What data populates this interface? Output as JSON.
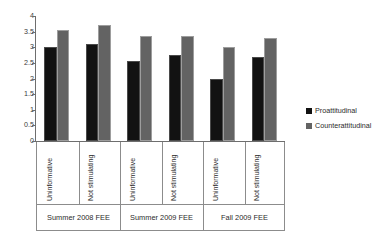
{
  "chart_data": {
    "type": "bar",
    "title": "",
    "subtitle": "",
    "xlabel": "",
    "ylabel": "",
    "ylim": [
      0,
      4
    ],
    "ytick_labels": [
      "4",
      "3.5",
      "3",
      "2.5",
      "2",
      "1.5",
      "1",
      "0.5",
      "0"
    ],
    "ytick_values": [
      4,
      3.5,
      3,
      2.5,
      2,
      1.5,
      1,
      0.5,
      0
    ],
    "grid": false,
    "legend_position": "right",
    "categories": [
      "Uninformative",
      "Not stimulating",
      "Uninformative",
      "Not stimulating",
      "Uninformative",
      "Not stimulating"
    ],
    "groups": [
      {
        "label": "Summer 2008 FEE",
        "categories": [
          "Uninformative",
          "Not stimulating"
        ]
      },
      {
        "label": "Summer 2009 FEE",
        "categories": [
          "Uninformative",
          "Not stimulating"
        ]
      },
      {
        "label": "Fall 2009 FEE",
        "categories": [
          "Uninformative",
          "Not stimulating"
        ]
      }
    ],
    "series": [
      {
        "name": "Proattitudinal",
        "color": "#121212",
        "values": [
          3.0,
          3.1,
          2.55,
          2.75,
          2.0,
          2.7
        ]
      },
      {
        "name": "Counterattitudinal",
        "color": "#636363",
        "values": [
          3.55,
          3.7,
          3.35,
          3.35,
          3.0,
          3.3
        ]
      }
    ],
    "legend": [
      {
        "label": "Proattitudinal",
        "color": "#121212"
      },
      {
        "label": "Counterattitudinal",
        "color": "#636363"
      }
    ]
  }
}
